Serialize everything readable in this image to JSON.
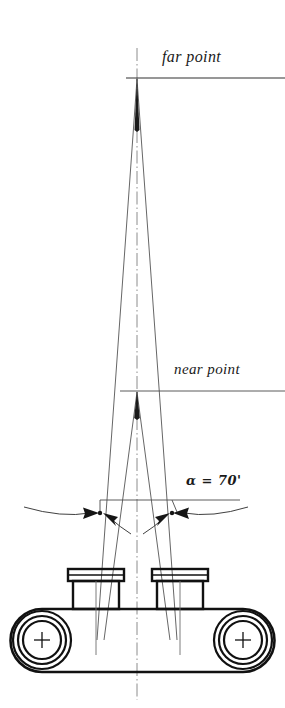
{
  "figure": {
    "labels": {
      "far_point": "far point",
      "near_point": "near point",
      "angle": "α = 70'"
    },
    "angle_value": 70,
    "angle_unit": "arcminutes",
    "colors": {
      "ink": "#1a1a1a",
      "thin_line": "#555555",
      "centerline": "#777777",
      "background": "#ffffff"
    },
    "geometry": {
      "center_x": 137,
      "far_point_y": 78,
      "near_point_y": 391,
      "dimension_line_y": 500,
      "eyepiece_left_x": 100,
      "eyepiece_right_x": 172,
      "body_top_y": 609,
      "body_bottom_y": 672
    },
    "elements": {
      "far_point_rule": "horizontal reference line at far point",
      "near_point_rule": "horizontal reference line at near point",
      "centerline": "vertical dash-dot axis of symmetry",
      "sight_lines": "four converging sight lines from eyepieces",
      "dimension_arcs": "curved angular dimension arcs with arrowheads",
      "instrument": "binocular body with two eyepieces and two prism housings"
    }
  }
}
